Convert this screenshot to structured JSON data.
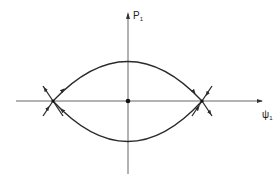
{
  "diagram": {
    "type": "phase-portrait",
    "axes": {
      "vertical_label": "P",
      "vertical_subscript": "1",
      "horizontal_label": "ψ",
      "horizontal_subscript": "1"
    },
    "fixed_points": [
      {
        "kind": "center",
        "x": 128,
        "y": 101
      },
      {
        "kind": "saddle",
        "x": 53,
        "y": 101
      },
      {
        "kind": "saddle",
        "x": 202,
        "y": 101
      }
    ],
    "colors": {
      "ink": "#2a2a2a",
      "background": "#ffffff"
    }
  }
}
